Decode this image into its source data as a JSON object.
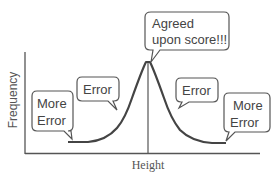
{
  "diagram": {
    "type": "bell-curve-annotation",
    "xlabel": "Height",
    "ylabel": "Frequency",
    "colors": {
      "line": "#444444",
      "axis": "#555555",
      "text": "#444444",
      "background": "#ffffff"
    },
    "callouts": [
      {
        "id": "peak",
        "lines": [
          "Agreed",
          "upon score!!!"
        ]
      },
      {
        "id": "left-error",
        "lines": [
          "Error"
        ]
      },
      {
        "id": "left-more-error",
        "lines": [
          "More",
          "Error"
        ]
      },
      {
        "id": "right-error",
        "lines": [
          "Error"
        ]
      },
      {
        "id": "right-more-error",
        "lines": [
          "More",
          "Error"
        ]
      }
    ]
  }
}
